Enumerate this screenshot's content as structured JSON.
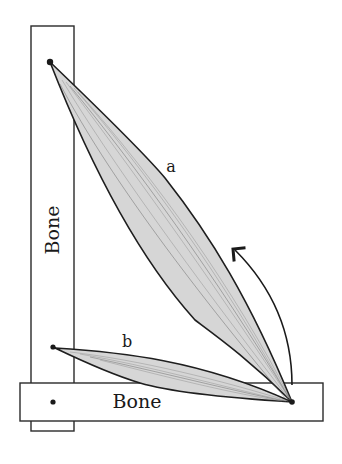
{
  "diagram": {
    "bones": [
      {
        "id": "vertical",
        "label": "Bone",
        "orientation": "vertical"
      },
      {
        "id": "horizontal",
        "label": "Bone",
        "orientation": "horizontal"
      }
    ],
    "muscles": [
      {
        "id": "a",
        "label": "a",
        "description": "long muscle from top of vertical bone to distal end of horizontal bone"
      },
      {
        "id": "b",
        "label": "b",
        "description": "short muscle from lower vertical bone to distal end of horizontal bone"
      }
    ],
    "arrow": {
      "meaning": "rotation-direction-icon"
    },
    "colors": {
      "stroke": "#1e1e1e",
      "muscle_fill": "#d6d6d6",
      "background": "#ffffff"
    }
  }
}
